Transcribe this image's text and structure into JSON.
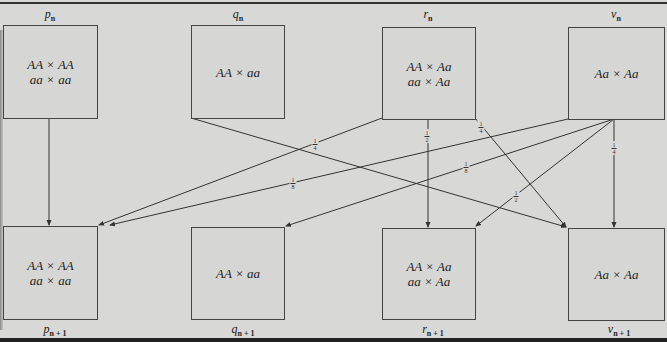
{
  "diagram": {
    "top_row": [
      {
        "id": "p_n",
        "label": "p",
        "sub": "n",
        "lines": [
          "AA × AA",
          "aa × aa"
        ]
      },
      {
        "id": "q_n",
        "label": "q",
        "sub": "n",
        "lines": [
          "AA × aa"
        ]
      },
      {
        "id": "r_n",
        "label": "r",
        "sub": "n",
        "lines": [
          "AA × Aa",
          "aa × Aa"
        ]
      },
      {
        "id": "v_n",
        "label": "v",
        "sub": "n",
        "lines": [
          "Aa × Aa"
        ]
      }
    ],
    "bottom_row": [
      {
        "id": "p_n1",
        "label": "p",
        "sub": "n + 1",
        "lines": [
          "AA × AA",
          "aa × aa"
        ]
      },
      {
        "id": "q_n1",
        "label": "q",
        "sub": "n + 1",
        "lines": [
          "AA × aa"
        ]
      },
      {
        "id": "r_n1",
        "label": "r",
        "sub": "n + 1",
        "lines": [
          "AA × Aa",
          "aa × Aa"
        ]
      },
      {
        "id": "v_n1",
        "label": "v",
        "sub": "n + 1",
        "lines": [
          "Aa × Aa"
        ]
      }
    ],
    "edges": [
      {
        "from": "p_n",
        "to": "p_n1",
        "label": ""
      },
      {
        "from": "q_n",
        "to": "v_n1",
        "label": ""
      },
      {
        "from": "r_n",
        "to": "p_n1",
        "label": "1/4",
        "num": "1",
        "den": "4"
      },
      {
        "from": "r_n",
        "to": "r_n1",
        "label": "1/2",
        "num": "1",
        "den": "2"
      },
      {
        "from": "r_n",
        "to": "v_n1",
        "label": "1/4",
        "num": "1",
        "den": "4"
      },
      {
        "from": "v_n",
        "to": "p_n1",
        "label": "1/8",
        "num": "1",
        "den": "8"
      },
      {
        "from": "v_n",
        "to": "q_n1",
        "label": "1/8",
        "num": "1",
        "den": "8"
      },
      {
        "from": "v_n",
        "to": "r_n1",
        "label": "1/2",
        "num": "1",
        "den": "2"
      },
      {
        "from": "v_n",
        "to": "v_n1",
        "label": "1/4",
        "num": "1",
        "den": "4"
      }
    ]
  }
}
